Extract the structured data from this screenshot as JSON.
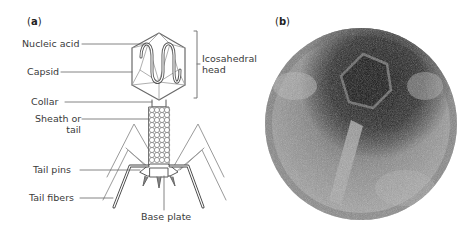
{
  "panels": {
    "a": {
      "label_open": "(",
      "label_letter": "a",
      "label_close": ")"
    },
    "b": {
      "label_open": "(",
      "label_letter": "b",
      "label_close": ")"
    }
  },
  "labels": {
    "nucleic_acid": "Nucleic acid",
    "capsid": "Capsid",
    "collar": "Collar",
    "sheath_line1": "Sheath or",
    "sheath_line2": "tail",
    "tail_pins": "Tail pins",
    "tail_fibers": "Tail fibers",
    "base_plate": "Base plate",
    "head_line1": "Icosahedral",
    "head_line2": "head"
  },
  "colors": {
    "line": "#5a5a5a",
    "label_text": "#3a3a3a",
    "photo_dark": "#1a1a1a",
    "photo_mid": "#7a7a7a",
    "photo_light": "#bdbdbd"
  }
}
